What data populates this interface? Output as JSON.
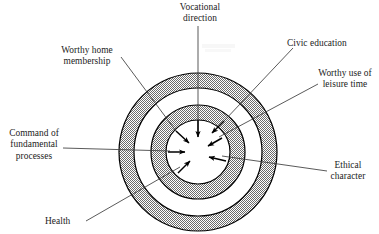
{
  "figure": {
    "kind": "concentric-target-diagram",
    "background_color": "#ffffff",
    "ring_fill_color": "#9a9a9a",
    "ring_stroke_color": "#000000",
    "center_dot_color": "#000000",
    "leader_line_color": "#3c3c3c",
    "text_color": "#1c1c1c"
  },
  "center": {
    "cx": 198,
    "cy": 152,
    "dot_radius": 9
  },
  "rings": [
    {
      "name": "outer-shaded-ring",
      "outer_radius": 79,
      "inner_radius": 64,
      "fill": "shaded"
    },
    {
      "name": "outer-white-gap",
      "outer_radius": 64,
      "inner_radius": 47,
      "fill": "white"
    },
    {
      "name": "inner-shaded-ring",
      "outer_radius": 47,
      "inner_radius": 32,
      "fill": "shaded"
    },
    {
      "name": "inner-white-core",
      "outer_radius": 32,
      "inner_radius": 9,
      "fill": "white"
    }
  ],
  "labels": {
    "vocational_direction": "Vocational\ndirection",
    "worthy_home_membership": "Worthy home\nmembership",
    "command_of_fundamental_processes": "Command of\nfundamental\nprocesses",
    "health": "Health",
    "civic_education": "Civic education",
    "worthy_use_of_leisure_time": "Worthy use of\nleisure time",
    "ethical_character": "Ethical\ncharacter"
  },
  "arrows": [
    {
      "name": "arrow-vocational-direction",
      "from_angle_deg": 90,
      "points_inward": true
    },
    {
      "name": "arrow-worthy-home",
      "from_angle_deg": 135,
      "points_inward": true
    },
    {
      "name": "arrow-command-processes",
      "from_angle_deg": 180,
      "points_inward": true
    },
    {
      "name": "arrow-health",
      "from_angle_deg": 225,
      "points_inward": true
    },
    {
      "name": "arrow-civic-education",
      "from_angle_deg": 55,
      "points_inward": true
    },
    {
      "name": "arrow-worthy-leisure",
      "from_angle_deg": 45,
      "points_inward": true
    },
    {
      "name": "arrow-ethical-character",
      "from_angle_deg": 340,
      "points_inward": true
    }
  ]
}
